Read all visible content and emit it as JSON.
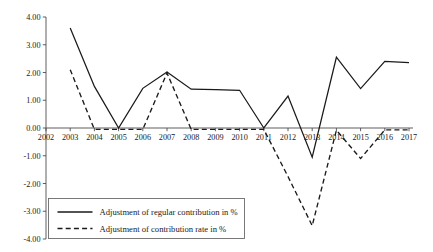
{
  "chart_data": {
    "type": "line",
    "title": "",
    "xlabel": "",
    "ylabel": "",
    "grid": false,
    "legend_position": "bottom-left",
    "x": [
      2002,
      2003,
      2004,
      2005,
      2006,
      2007,
      2008,
      2009,
      2010,
      2011,
      2012,
      2013,
      2014,
      2015,
      2016,
      2017
    ],
    "categories": [
      "2002",
      "2003",
      "2004",
      "2005",
      "2006",
      "2007",
      "2008",
      "2009",
      "2010",
      "2011",
      "2012",
      "2013",
      "2014",
      "2015",
      "2016",
      "2017"
    ],
    "xlim": [
      2002,
      2017
    ],
    "ylim": [
      -4.0,
      4.0
    ],
    "ytick_labels": [
      "4.00",
      "3.00",
      "2.00",
      "1.00",
      "0.00",
      "-1.00",
      "-2.00",
      "-3.00",
      "-4.00"
    ],
    "ytick_values": [
      4.0,
      3.0,
      2.0,
      1.0,
      0.0,
      -1.0,
      -2.0,
      -3.0,
      -4.0
    ],
    "xtick_labels": [
      "2002",
      "2003",
      "2004",
      "2005",
      "2006",
      "2007",
      "2008",
      "2009",
      "2010",
      "2011",
      "2012",
      "2013",
      "2014",
      "2015",
      "2016",
      "2017"
    ],
    "series": [
      {
        "name": "Adjustment of regular contribution in %",
        "style": "solid",
        "color": "#1a1a1a",
        "x": [
          2003,
          2004,
          2005,
          2006,
          2007,
          2008,
          2009,
          2010,
          2011,
          2012,
          2013,
          2014,
          2015,
          2016,
          2017
        ],
        "values": [
          3.6,
          1.5,
          0.0,
          1.43,
          2.02,
          1.4,
          1.38,
          1.36,
          0.0,
          1.15,
          -1.05,
          2.55,
          1.42,
          2.4,
          2.36
        ]
      },
      {
        "name": "Adjustment of contribution rate in %",
        "style": "dashed",
        "color": "#1a1a1a",
        "x": [
          2003,
          2004,
          2005,
          2006,
          2007,
          2008,
          2009,
          2010,
          2011,
          2012,
          2013,
          2014,
          2015,
          2016,
          2017
        ],
        "values": [
          2.1,
          -0.05,
          -0.05,
          -0.05,
          1.98,
          -0.05,
          -0.05,
          -0.05,
          -0.05,
          -1.75,
          -3.52,
          -0.08,
          -1.1,
          -0.07,
          -0.07
        ]
      }
    ]
  },
  "legend": {
    "items": [
      {
        "label": "Adjustment of regular contribution in %",
        "style": "solid"
      },
      {
        "label": "Adjustment of contribution rate in %",
        "style": "dashed"
      }
    ]
  }
}
